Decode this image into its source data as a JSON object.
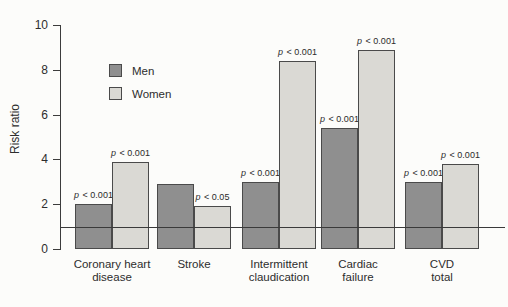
{
  "chart_data": {
    "type": "bar",
    "title": "",
    "ylabel": "Risk ratio",
    "ylim": [
      0,
      10
    ],
    "yticks": [
      0,
      2,
      4,
      6,
      8,
      10
    ],
    "reference_line_y": 1,
    "grid": false,
    "legend_position": "upper-left-inside",
    "categories": [
      "Coronary heart disease",
      "Stroke",
      "Intermittent claudication",
      "Cardiac failure",
      "CVD total"
    ],
    "category_label_lines": [
      [
        "Coronary heart",
        "disease"
      ],
      [
        "Stroke"
      ],
      [
        "Intermittent",
        "claudication"
      ],
      [
        "Cardiac",
        "failure"
      ],
      [
        "CVD",
        "total"
      ]
    ],
    "series": [
      {
        "name": "Men",
        "color": "#8f8f8f",
        "border_color": "#4a4a4a",
        "values": [
          2.0,
          2.9,
          3.0,
          5.4,
          3.0
        ],
        "p_labels": [
          "p < 0.001",
          null,
          "p < 0.001",
          "p < 0.001",
          "p < 0.001"
        ]
      },
      {
        "name": "Women",
        "color": "#dad9d4",
        "border_color": "#4a4a4a",
        "values": [
          3.9,
          1.9,
          8.4,
          8.9,
          3.8
        ],
        "p_labels": [
          "p < 0.001",
          "p < 0.05",
          "p < 0.001",
          "p < 0.001",
          "p < 0.001"
        ]
      }
    ],
    "axis_color": "#3c3c3c",
    "reference_line_color": "#3a3a3a",
    "background_color": "#fcfcfa"
  }
}
